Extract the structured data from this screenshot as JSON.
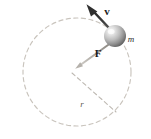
{
  "figure": {
    "name": "uniform-circular-motion-diagram",
    "width": 151,
    "height": 139,
    "background_color": "#ffffff"
  },
  "labels": {
    "velocity": "v",
    "force": "F",
    "radius": "r",
    "mass": "m"
  },
  "colors": {
    "circle_dash": "#c9c4bd",
    "radius_dash": "#bdb8b1",
    "velocity_arrow": "#3b3b3b",
    "force_arrow": "#a8a49e",
    "sphere_light": "#f2f2f2",
    "sphere_mid": "#b9b9b9",
    "sphere_dark": "#6e6e6e",
    "label_text": "#1a1a1a",
    "radius_text": "#5e5a55"
  },
  "geometry": {
    "circle_center_x": 77,
    "circle_center_y": 72,
    "circle_radius": 54,
    "sphere_center_x": 115,
    "sphere_center_y": 36,
    "sphere_radius": 11,
    "velocity_tip_x": 88,
    "velocity_tip_y": 5,
    "force_tip_x": 76,
    "force_tip_y": 63,
    "radius_vertex_x": 72,
    "radius_vertex_y": 73,
    "radius_end_x": 116,
    "radius_end_y": 112
  },
  "label_positions": {
    "velocity": {
      "x": 107,
      "y": 15
    },
    "force": {
      "x": 98,
      "y": 57
    },
    "radius": {
      "x": 82,
      "y": 107
    },
    "mass": {
      "x": 131,
      "y": 42
    }
  },
  "font_sizes": {
    "velocity": 11,
    "force": 11,
    "radius": 9,
    "mass": 9
  }
}
